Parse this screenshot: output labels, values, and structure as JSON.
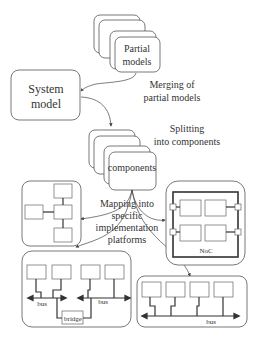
{
  "diagram": {
    "partial_models": {
      "line1": "Partial",
      "line2": "models"
    },
    "system_model": {
      "line1": "System",
      "line2": "model"
    },
    "merging_label": {
      "line1": "Merging of",
      "line2": "partial models"
    },
    "splitting_label": {
      "line1": "Splitting",
      "line2": "into components"
    },
    "components": {
      "label": "components"
    },
    "mapping_label": {
      "line1": "Mapping into",
      "line2": "specific",
      "line3": "implementation",
      "line4": "platforms"
    },
    "noc_platform": {
      "label": "NoC"
    },
    "bridge_platform": {
      "bus_left": "bus",
      "bus_right": "bus",
      "bridge": "bridge"
    },
    "bus_platform": {
      "bus": "bus"
    }
  }
}
